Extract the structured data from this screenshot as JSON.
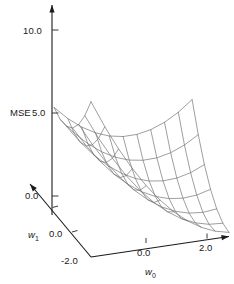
{
  "chart_data": {
    "type": "surface",
    "title": "",
    "xlabel": "w_0",
    "ylabel": "w_1",
    "zlabel": "MSE",
    "projection": "3d-wireframe",
    "grid": false,
    "legend": null,
    "x": [
      -2.0,
      -1.5,
      -1.0,
      -0.5,
      0.0,
      0.5,
      1.0,
      1.5,
      2.0,
      2.5,
      3.0
    ],
    "y": [
      -2.0,
      -1.5,
      -1.0,
      -0.5,
      0.0,
      0.5,
      1.0
    ],
    "xlim": [
      -2.0,
      3.0
    ],
    "ylim": [
      -2.0,
      1.0
    ],
    "zlim": [
      0.0,
      11.0
    ],
    "surface_function": "MSE(w0,w1) = 0.62*(w0-0.35)^2 + 1.55*(w1+0.55)^2 + 0.55*(w0-0.35)*(w1+0.55)",
    "z": [
      [
        9.41,
        8.1,
        7.1,
        6.42,
        6.05,
        6.0,
        6.26
      ],
      [
        7.78,
        6.61,
        5.75,
        5.21,
        4.98,
        5.07,
        5.47
      ],
      [
        6.31,
        5.28,
        4.56,
        4.16,
        4.07,
        4.3,
        4.84
      ],
      [
        5.0,
        4.11,
        3.53,
        3.27,
        3.32,
        3.69,
        4.37
      ],
      [
        3.85,
        3.1,
        2.66,
        2.54,
        2.73,
        3.24,
        4.06
      ],
      [
        2.86,
        2.25,
        1.95,
        1.97,
        2.3,
        2.95,
        3.91
      ],
      [
        2.03,
        1.56,
        1.4,
        1.56,
        2.03,
        2.82,
        3.92
      ],
      [
        1.36,
        1.03,
        1.01,
        1.31,
        1.92,
        2.85,
        4.09
      ],
      [
        0.85,
        0.66,
        0.78,
        1.22,
        1.97,
        3.04,
        4.42
      ],
      [
        0.5,
        0.45,
        0.71,
        1.29,
        2.18,
        3.39,
        4.91
      ],
      [
        0.31,
        0.4,
        0.8,
        1.52,
        2.55,
        3.9,
        5.56
      ]
    ],
    "axes": {
      "z": {
        "ticks": [
          0.0,
          5.0,
          10.0
        ],
        "tick_labels": [
          "0.0",
          "5.0",
          "10.0"
        ],
        "name": "MSE"
      },
      "x": {
        "ticks": [
          0.0,
          2.0
        ],
        "tick_labels": [
          "0.0",
          "2.0"
        ],
        "name": "w",
        "name_sub": "0"
      },
      "y": {
        "ticks": [
          -2.0,
          0.0
        ],
        "tick_labels": [
          "-2.0",
          "0.0"
        ],
        "name": "w",
        "name_sub": "1"
      }
    },
    "colors": {
      "mesh": "#6a6a6a",
      "axis": "#1a1a1a",
      "background": "#ffffff"
    }
  },
  "labels": {
    "z_axis_name": "MSE",
    "z_tick_10": "10.0",
    "z_tick_5": "5.0",
    "z_tick_0": "0.0",
    "x_tick_0": "0.0",
    "x_tick_2": "2.0",
    "y_tick_0": "0.0",
    "y_tick_neg2": "-2.0",
    "x_axis_name": "w",
    "x_axis_sub": "0",
    "y_axis_name": "w",
    "y_axis_sub": "1"
  }
}
